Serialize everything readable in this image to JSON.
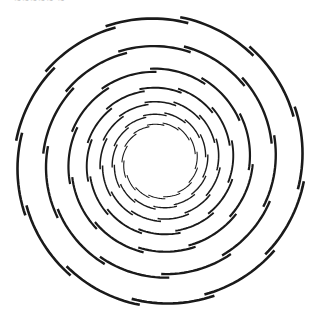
{
  "figure": {
    "caption_fragment": "~~~~~ ~",
    "center": [
      160,
      161
    ],
    "stroke_color": "#1a1a1a",
    "rings": [
      {
        "radius": 143,
        "segments": 12,
        "stroke": 2.6,
        "step": 4.5,
        "phase": 8
      },
      {
        "radius": 115,
        "segments": 11,
        "stroke": 2.4,
        "step": 4.0,
        "phase": 20
      },
      {
        "radius": 91,
        "segments": 11,
        "stroke": 2.2,
        "step": 3.6,
        "phase": 2
      },
      {
        "radius": 73,
        "segments": 12,
        "stroke": 1.9,
        "step": 3.2,
        "phase": 14
      },
      {
        "radius": 59,
        "segments": 13,
        "stroke": 1.6,
        "step": 2.8,
        "phase": 6
      },
      {
        "radius": 47,
        "segments": 14,
        "stroke": 1.4,
        "step": 2.5,
        "phase": 18
      },
      {
        "radius": 37,
        "segments": 15,
        "stroke": 1.1,
        "step": 2.2,
        "phase": 10
      }
    ]
  }
}
